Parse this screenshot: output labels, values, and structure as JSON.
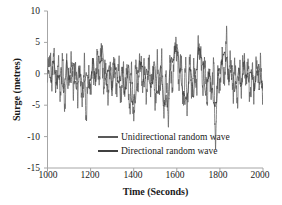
{
  "figure": {
    "background_color": "#ffffff",
    "axis_color": "#a6a6a6",
    "text_color": "#1a1a1a"
  },
  "chart_data": {
    "type": "line",
    "title": "",
    "xlabel": "Time (Seconds)",
    "ylabel": "Surge (metres)",
    "xlim": [
      1000,
      2000
    ],
    "ylim": [
      -15,
      10
    ],
    "xticks": [
      1000,
      1200,
      1400,
      1600,
      1800,
      2000
    ],
    "yticks": [
      10,
      5,
      0,
      -5,
      -10,
      -15
    ],
    "xtick_labels": [
      "1000",
      "1200",
      "1400",
      "1600",
      "1800",
      "2000"
    ],
    "ytick_labels": [
      "10",
      "5",
      "0",
      "-5",
      "-10",
      "-15"
    ],
    "grid": false,
    "legend_position": "lower-center-inside",
    "series": [
      {
        "name": "Unidirectional random wave",
        "color": "#595959",
        "line_width": 0.7,
        "description": "High-frequency irregular surge oscillation about zero, amplitude mostly between -5 and +4 m, with a deep trough near t=1780 s reaching about -10.3 m and a sharp crest near t=1830 s reaching about +5.8 m",
        "summary_stats": {
          "mean": -0.2,
          "min": -10.3,
          "max": 5.8,
          "std": 1.9,
          "dominant_period_s": 8
        },
        "sampled_points": [
          [
            1000,
            0.4
          ],
          [
            1010,
            2.6
          ],
          [
            1020,
            -1.2
          ],
          [
            1030,
            3.1
          ],
          [
            1040,
            -2.4
          ],
          [
            1050,
            1.8
          ],
          [
            1060,
            -3.6
          ],
          [
            1070,
            2.2
          ],
          [
            1080,
            -5.3
          ],
          [
            1090,
            0.9
          ],
          [
            1100,
            -1.6
          ],
          [
            1110,
            2.4
          ],
          [
            1120,
            -2.1
          ],
          [
            1130,
            1.1
          ],
          [
            1140,
            -3.2
          ],
          [
            1150,
            0.6
          ],
          [
            1160,
            -4.4
          ],
          [
            1170,
            1.4
          ],
          [
            1180,
            -6.7
          ],
          [
            1190,
            0.2
          ],
          [
            1200,
            -2.8
          ],
          [
            1210,
            1.9
          ],
          [
            1220,
            -1.4
          ],
          [
            1230,
            2.7
          ],
          [
            1240,
            -0.8
          ],
          [
            1250,
            4.1
          ],
          [
            1260,
            -2.2
          ],
          [
            1270,
            1.3
          ],
          [
            1280,
            -3.8
          ],
          [
            1290,
            0.7
          ],
          [
            1300,
            -1.1
          ],
          [
            1310,
            2.0
          ],
          [
            1320,
            -2.9
          ],
          [
            1330,
            1.6
          ],
          [
            1340,
            -4.1
          ],
          [
            1350,
            0.3
          ],
          [
            1360,
            -2.6
          ],
          [
            1370,
            1.2
          ],
          [
            1380,
            -5.8
          ],
          [
            1390,
            0.5
          ],
          [
            1400,
            -7.3
          ],
          [
            1410,
            1.7
          ],
          [
            1420,
            -2.3
          ],
          [
            1430,
            2.5
          ],
          [
            1440,
            -1.8
          ],
          [
            1450,
            1.0
          ],
          [
            1460,
            -3.4
          ],
          [
            1470,
            2.1
          ],
          [
            1480,
            -2.0
          ],
          [
            1490,
            0.8
          ],
          [
            1500,
            -4.7
          ],
          [
            1510,
            1.5
          ],
          [
            1520,
            -3.0
          ],
          [
            1530,
            2.3
          ],
          [
            1540,
            -6.5
          ],
          [
            1550,
            0.1
          ],
          [
            1560,
            -6.8
          ],
          [
            1570,
            1.9
          ],
          [
            1580,
            -2.7
          ],
          [
            1590,
            4.4
          ],
          [
            1600,
            3.8
          ],
          [
            1610,
            -1.5
          ],
          [
            1620,
            2.8
          ],
          [
            1630,
            -4.9
          ],
          [
            1640,
            1.1
          ],
          [
            1650,
            -5.1
          ],
          [
            1660,
            2.6
          ],
          [
            1670,
            -3.3
          ],
          [
            1680,
            1.4
          ],
          [
            1690,
            -2.5
          ],
          [
            1700,
            4.3
          ],
          [
            1710,
            3.2
          ],
          [
            1720,
            -1.9
          ],
          [
            1730,
            2.2
          ],
          [
            1740,
            -4.2
          ],
          [
            1750,
            0.9
          ],
          [
            1760,
            -3.7
          ],
          [
            1770,
            1.8
          ],
          [
            1780,
            -10.3
          ],
          [
            1790,
            0.4
          ],
          [
            1800,
            -2.4
          ],
          [
            1810,
            2.9
          ],
          [
            1820,
            -1.7
          ],
          [
            1830,
            5.8
          ],
          [
            1840,
            -0.6
          ],
          [
            1850,
            2.4
          ],
          [
            1860,
            -3.1
          ],
          [
            1870,
            1.6
          ],
          [
            1880,
            -4.6
          ],
          [
            1890,
            0.7
          ],
          [
            1900,
            -2.2
          ],
          [
            1910,
            2.7
          ],
          [
            1920,
            -1.3
          ],
          [
            1930,
            1.9
          ],
          [
            1940,
            -3.9
          ],
          [
            1950,
            0.5
          ],
          [
            1960,
            -2.8
          ],
          [
            1970,
            2.1
          ],
          [
            1980,
            -1.5
          ],
          [
            1990,
            1.2
          ],
          [
            2000,
            -4.3
          ]
        ]
      },
      {
        "name": "Directional random wave",
        "color": "#404040",
        "line_width": 0.7,
        "description": "Lower-frequency smoother surge response overlying the unidirectional trace, amplitude mostly between -5 and +5 m with broad crests near t=1600 s and t=1705 s reaching about +4.5 m",
        "summary_stats": {
          "mean": -0.3,
          "min": -7.0,
          "max": 4.8,
          "std": 1.7,
          "dominant_period_s": 18
        },
        "sampled_points": [
          [
            1000,
            1.2
          ],
          [
            1015,
            -0.8
          ],
          [
            1030,
            2.0
          ],
          [
            1045,
            -1.6
          ],
          [
            1060,
            0.6
          ],
          [
            1075,
            -2.6
          ],
          [
            1090,
            1.4
          ],
          [
            1105,
            -1.0
          ],
          [
            1120,
            0.9
          ],
          [
            1135,
            -2.1
          ],
          [
            1150,
            1.1
          ],
          [
            1165,
            -3.4
          ],
          [
            1180,
            0.3
          ],
          [
            1195,
            -1.9
          ],
          [
            1210,
            1.6
          ],
          [
            1225,
            -0.7
          ],
          [
            1240,
            2.2
          ],
          [
            1255,
            3.4
          ],
          [
            1270,
            -1.2
          ],
          [
            1285,
            0.8
          ],
          [
            1300,
            -2.0
          ],
          [
            1315,
            1.3
          ],
          [
            1330,
            -1.5
          ],
          [
            1345,
            0.4
          ],
          [
            1360,
            -2.9
          ],
          [
            1375,
            1.0
          ],
          [
            1390,
            -3.6
          ],
          [
            1405,
            -4.8
          ],
          [
            1420,
            0.7
          ],
          [
            1435,
            1.8
          ],
          [
            1450,
            -1.1
          ],
          [
            1465,
            0.5
          ],
          [
            1480,
            -2.3
          ],
          [
            1495,
            1.2
          ],
          [
            1510,
            -3.1
          ],
          [
            1525,
            0.6
          ],
          [
            1540,
            -4.2
          ],
          [
            1555,
            -5.0
          ],
          [
            1570,
            0.9
          ],
          [
            1585,
            2.8
          ],
          [
            1600,
            4.5
          ],
          [
            1615,
            0.4
          ],
          [
            1630,
            -3.3
          ],
          [
            1645,
            -4.6
          ],
          [
            1660,
            1.0
          ],
          [
            1675,
            -2.7
          ],
          [
            1690,
            0.5
          ],
          [
            1705,
            4.4
          ],
          [
            1720,
            1.5
          ],
          [
            1735,
            -2.8
          ],
          [
            1750,
            0.3
          ],
          [
            1765,
            -3.0
          ],
          [
            1780,
            -5.4
          ],
          [
            1795,
            0.6
          ],
          [
            1810,
            1.7
          ],
          [
            1825,
            3.6
          ],
          [
            1840,
            -0.9
          ],
          [
            1855,
            1.1
          ],
          [
            1870,
            -2.4
          ],
          [
            1885,
            0.2
          ],
          [
            1900,
            -1.6
          ],
          [
            1915,
            1.4
          ],
          [
            1930,
            -1.2
          ],
          [
            1945,
            0.7
          ],
          [
            1960,
            -2.5
          ],
          [
            1975,
            1.0
          ],
          [
            1990,
            -0.4
          ],
          [
            2000,
            -2.2
          ]
        ]
      }
    ]
  },
  "legend": {
    "entries": [
      {
        "label": "Unidirectional random wave",
        "color": "#595959"
      },
      {
        "label": "Directional random wave",
        "color": "#404040"
      }
    ]
  }
}
